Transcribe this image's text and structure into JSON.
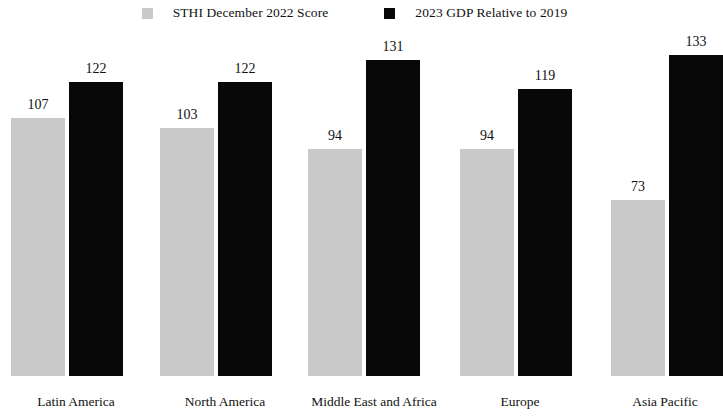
{
  "chart_data": {
    "type": "bar",
    "title": "",
    "subtitle": "",
    "xlabel": "",
    "ylabel": "",
    "ylim": [
      0,
      140
    ],
    "grid": false,
    "legend_position": "top-center",
    "categories": [
      "Latin America",
      "North America",
      "Middle East and Africa",
      "Europe",
      "Asia Pacific"
    ],
    "series": [
      {
        "name": "STHI December 2022 Score",
        "color": "#c9c9c9",
        "values": [
          107,
          103,
          94,
          94,
          73
        ]
      },
      {
        "name": "2023 GDP Relative to 2019",
        "color": "#080808",
        "values": [
          122,
          122,
          131,
          119,
          133
        ]
      }
    ],
    "value_labels": [
      [
        "107",
        "122"
      ],
      [
        "103",
        "122"
      ],
      [
        "94",
        "131"
      ],
      [
        "94",
        "119"
      ],
      [
        "73",
        "133"
      ]
    ]
  },
  "legend": {
    "entries": [
      {
        "label": "STHI December 2022 Score",
        "swatch_name": "legend-swatch-sthi"
      },
      {
        "label": "2023 GDP Relative to 2019",
        "swatch_name": "legend-swatch-gdp"
      }
    ]
  }
}
